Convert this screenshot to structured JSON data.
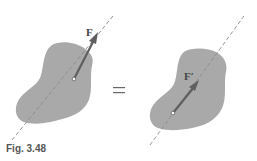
{
  "figure": {
    "caption": "Fig. 3.48",
    "equals_sign": "=",
    "left_diagram": {
      "force_label": "F",
      "body_color": "#a9a9a9",
      "arrow_color": "#5f5f5f",
      "line_of_action": "dashed"
    },
    "right_diagram": {
      "force_label": "F′",
      "body_color": "#a9a9a9",
      "arrow_color": "#5f5f5f",
      "line_of_action": "dashed"
    }
  }
}
